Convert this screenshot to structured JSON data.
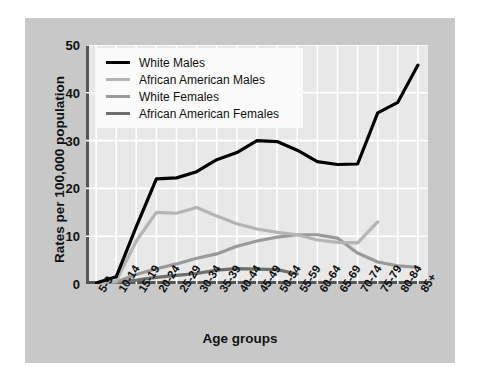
{
  "chart_data": {
    "type": "line",
    "title": "",
    "xlabel": "Age groups",
    "ylabel": "Rates per 100,000 population",
    "categories": [
      "5-9",
      "10-14",
      "15-19",
      "20-24",
      "25-29",
      "30-34",
      "35-39",
      "40-44",
      "45-49",
      "50-54",
      "55-59",
      "60-64",
      "65-69",
      "70-74",
      "75-79",
      "80-84",
      "85+"
    ],
    "ylim": [
      0,
      50
    ],
    "yticks": [
      0,
      10,
      20,
      30,
      40,
      50
    ],
    "grid": true,
    "legend_position": "upper-left-inside",
    "series": [
      {
        "name": "White Males",
        "color": "#000000",
        "width": 3.2,
        "values": [
          0.2,
          1.5,
          12.0,
          22.0,
          22.2,
          23.5,
          26.0,
          27.5,
          30.0,
          29.8,
          28.0,
          25.6,
          25.0,
          25.1,
          35.8,
          38.0,
          45.8
        ]
      },
      {
        "name": "African American Males",
        "color": "#b4b4b4",
        "width": 3.2,
        "values": [
          0.2,
          0.6,
          9.0,
          15.0,
          14.8,
          16.0,
          14.2,
          12.6,
          11.5,
          10.8,
          10.3,
          9.2,
          8.7,
          8.6,
          13.0,
          null,
          null
        ]
      },
      {
        "name": "White Females",
        "color": "#9a9a9a",
        "width": 3.2,
        "values": [
          0.2,
          0.4,
          2.0,
          3.2,
          4.2,
          5.4,
          6.3,
          7.9,
          9.0,
          9.8,
          10.3,
          10.3,
          9.6,
          6.5,
          4.6,
          3.8,
          3.5
        ]
      },
      {
        "name": "African American Females",
        "color": "#6e6e6e",
        "width": 3.2,
        "values": [
          0.2,
          0.3,
          0.8,
          1.4,
          1.8,
          2.2,
          2.9,
          3.2,
          3.1,
          3.0,
          2.1,
          null,
          null,
          null,
          null,
          null,
          null
        ]
      }
    ]
  },
  "legend": {
    "items": [
      {
        "label": "White Males",
        "color": "#000000"
      },
      {
        "label": "African American Males",
        "color": "#b4b4b4"
      },
      {
        "label": "White Females",
        "color": "#9a9a9a"
      },
      {
        "label": "African American Females",
        "color": "#6e6e6e"
      }
    ]
  },
  "colors": {
    "panel": "#c8c8c8",
    "plot_background": "#e8e8e8",
    "gridline": "#ffffff",
    "axis": "#555555",
    "text": "#111111",
    "legend_background": "#fbfbfb"
  }
}
